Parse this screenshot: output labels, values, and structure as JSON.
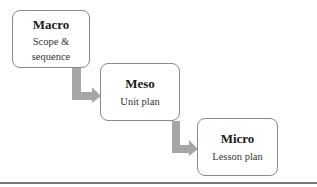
{
  "diagram": {
    "levels": [
      {
        "title": "Macro",
        "subtitle_lines": [
          "Scope &",
          "sequence"
        ]
      },
      {
        "title": "Meso",
        "subtitle_lines": [
          "Unit plan"
        ]
      },
      {
        "title": "Micro",
        "subtitle_lines": [
          "Lesson plan"
        ]
      }
    ],
    "arrow_color": "#a6a6a6",
    "border_color": "#8a8a8a"
  }
}
